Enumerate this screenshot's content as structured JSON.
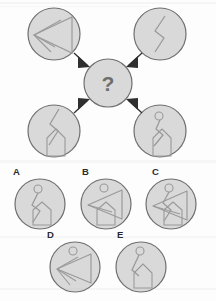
{
  "puzzle": {
    "type": "visual-analogy-matrix",
    "question_mark": "?",
    "colors": {
      "circle_fill": "#d9d9d9",
      "circle_stroke": "#6f6f6f",
      "glyph_stroke": "#9a9a9a",
      "arrow_fill": "#2f2f2f",
      "label_text": "#2b2b2b",
      "question_text": "#6e6e6e",
      "page_background": "#fdfdfd"
    },
    "prompt_circles": [
      {
        "id": "top-left",
        "position": "top-left",
        "cx": 54,
        "cy": 34,
        "r": 26,
        "elements": [
          "triangle-left",
          "arrowhead-lines"
        ],
        "description": "Left-pointing triangle with internal converging lines"
      },
      {
        "id": "top-right",
        "position": "top-right",
        "cx": 160,
        "cy": 34,
        "r": 26,
        "elements": [
          "zigzag-line"
        ],
        "description": "Vertical zigzag chevron line"
      },
      {
        "id": "bottom-left",
        "position": "bottom-left",
        "cx": 54,
        "cy": 131,
        "r": 26,
        "elements": [
          "zigzag-line",
          "house-pentagon"
        ],
        "description": "Zigzag line over a house pentagon shape"
      },
      {
        "id": "bottom-right",
        "position": "bottom-right",
        "cx": 160,
        "cy": 131,
        "r": 26,
        "elements": [
          "small-circle",
          "zigzag-line",
          "house-pentagon"
        ],
        "description": "Small circle on a zigzag line above a house pentagon"
      }
    ],
    "center_circle": {
      "id": "center-unknown",
      "cx": 108,
      "cy": 83,
      "r": 24,
      "label": "?"
    },
    "arrows": [
      {
        "id": "arrow-from-top-left",
        "from": "top-left",
        "to": "center"
      },
      {
        "id": "arrow-from-top-right",
        "from": "top-right",
        "to": "center"
      },
      {
        "id": "arrow-from-bottom-left",
        "from": "bottom-left",
        "to": "center"
      },
      {
        "id": "arrow-from-bottom-right",
        "from": "bottom-right",
        "to": "center"
      }
    ],
    "options": [
      {
        "id": "A",
        "label": "A",
        "label_x": 13,
        "label_y": 168,
        "cx": 40,
        "cy": 204,
        "r": 25,
        "elements": [
          "small-circle",
          "stem-line",
          "zigzag-line",
          "house-pentagon"
        ],
        "description": "Small circle on stem, zigzag, house pentagon"
      },
      {
        "id": "B",
        "label": "B",
        "label_x": 82,
        "label_y": 168,
        "cx": 106,
        "cy": 204,
        "r": 25,
        "elements": [
          "small-circle",
          "triangle-left",
          "house-pentagon"
        ],
        "description": "Small circle, left-pointing triangle, house pentagon"
      },
      {
        "id": "C",
        "label": "C",
        "label_x": 152,
        "label_y": 168,
        "cx": 171,
        "cy": 204,
        "r": 25,
        "elements": [
          "small-circle",
          "triangle-left",
          "zigzag-line",
          "house-pentagon"
        ],
        "description": "Small circle, triangle, zigzag and house pentagon"
      },
      {
        "id": "D",
        "label": "D",
        "label_x": 47,
        "label_y": 231,
        "cx": 75,
        "cy": 267,
        "r": 25,
        "elements": [
          "small-circle",
          "triangle-left",
          "arrowhead-lines"
        ],
        "description": "Small circle above a left-pointing triangle with lines"
      },
      {
        "id": "E",
        "label": "E",
        "label_x": 117,
        "label_y": 231,
        "cx": 141,
        "cy": 267,
        "r": 25,
        "elements": [
          "small-circle",
          "stem-line",
          "house-pentagon"
        ],
        "description": "Small circle on stem above a house pentagon"
      }
    ]
  }
}
